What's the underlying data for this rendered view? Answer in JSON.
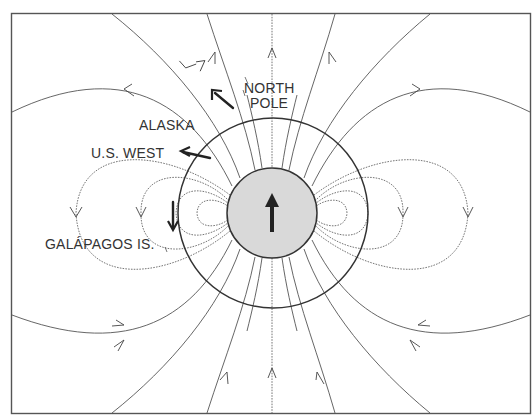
{
  "diagram": {
    "type": "dipole magnetic field lines around Earth",
    "labels": {
      "north_pole_line1": "NORTH",
      "north_pole_line2": "POLE",
      "alaska": "ALASKA",
      "us_west": "U.S. WEST",
      "galapagos": "GALÁPAGOS IS."
    },
    "elements": {
      "core": "earth-core-circle",
      "outer_circle": "earth-surface-circle",
      "dipole_direction": "up"
    },
    "colors": {
      "line": "#555555",
      "core_fill": "#d9d9d9",
      "background": "#ffffff"
    }
  }
}
